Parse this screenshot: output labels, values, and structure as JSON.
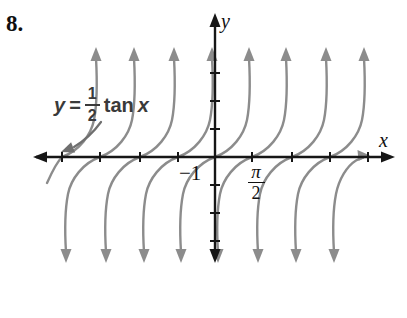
{
  "figure": {
    "number": "8."
  },
  "equation": {
    "lhs": "y",
    "eq": "=",
    "num": "1",
    "den": "2",
    "fn": "tan",
    "arg": "x"
  },
  "axis_labels": {
    "x": "x",
    "y": "y"
  },
  "tick_labels": {
    "neg_one": "−1",
    "pi_num": "π",
    "pi_den": "2"
  },
  "colors": {
    "background": "#ffffff",
    "curve": "#8c8c8c",
    "axis": "#161616",
    "leader": "#6f6f6f",
    "equation_text": "#3a3a3a",
    "text": "#101010"
  },
  "chart_data": {
    "type": "line",
    "function": "y = (1/2) tan x",
    "xlabel": "x",
    "ylabel": "y",
    "grid": false,
    "legend": "none",
    "x_tick_unit": "π/2",
    "labeled_x_tick": "π/2 (first tick right of origin)",
    "labeled_y_tick": "−1 (first tick below origin)",
    "x_ticks_units_of_half_pi": [
      -4,
      -3,
      -2,
      -1,
      1,
      2,
      3,
      4
    ],
    "y_ticks_units": [
      3,
      2,
      1,
      -1,
      -2,
      -3
    ],
    "branch_x_intercepts_units_of_half_pi": [
      -4,
      -3,
      -2,
      -1,
      0,
      1,
      2,
      3,
      4
    ],
    "branch_behavior": "each branch falls to −∞ on its left (down arrow) and rises to +∞ on its right (up arrow)",
    "annotation": "curved leader arrow from equation label pointing to leftmost branch at the x-axis",
    "layout_px": {
      "width": 407,
      "height": 318,
      "origin": [
        215,
        157
      ],
      "x_axis": {
        "y": 157,
        "x_min": 33,
        "x_max": 395
      },
      "y_axis": {
        "x": 215,
        "y_min": 13,
        "y_max": 263
      },
      "x_tick_px": [
        62,
        100,
        140,
        178,
        252,
        292,
        330,
        368
      ],
      "y_tick_px": [
        73,
        101,
        129,
        185,
        213,
        241
      ],
      "branches": [
        {
          "x": 62,
          "style": "partial-left"
        },
        {
          "x": 100
        },
        {
          "x": 140
        },
        {
          "x": 178
        },
        {
          "x": 215
        },
        {
          "x": 252
        },
        {
          "x": 292
        },
        {
          "x": 330
        },
        {
          "x": 368,
          "style": "truncated-right"
        }
      ],
      "arm_offset": 34,
      "top_arrow_tip_y": 47,
      "bottom_arrow_tip_y": 263,
      "leader": {
        "path": "M 101 122 C 93 133, 84 141, 74 147",
        "arrow_points": "61,152 75.1,152.4 71.1,142.2"
      },
      "right_truncation_arrow_points": "370,155.5 357.5,150 358.5,161"
    }
  }
}
